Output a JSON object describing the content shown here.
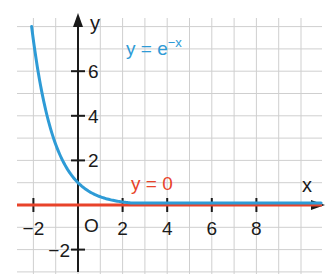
{
  "chart_data": {
    "type": "line",
    "title": "",
    "xlabel": "x",
    "ylabel": "y",
    "xlim": [
      -2.8,
      10.9
    ],
    "ylim": [
      -3.0,
      8.3
    ],
    "grid": true,
    "grid_step": 1,
    "x_ticks": [
      -2,
      2,
      4,
      6,
      8
    ],
    "x_tick_labels": [
      "−2",
      "2",
      "4",
      "6",
      "8"
    ],
    "y_ticks": [
      -2,
      2,
      4,
      6
    ],
    "y_tick_labels": [
      "−2",
      "2",
      "4",
      "6"
    ],
    "origin_label": "O",
    "series": [
      {
        "name": "y = e^(−x)",
        "label_text": "y = e",
        "label_sup": "−x",
        "color": "#2e9bd6",
        "function": "exp(-x)",
        "x": [
          -2.1,
          -2,
          -1.5,
          -1,
          -0.5,
          0,
          0.5,
          1,
          1.5,
          2,
          3,
          4,
          5,
          6,
          8,
          10.9
        ],
        "y": [
          8.17,
          7.39,
          4.48,
          2.72,
          1.65,
          1.0,
          0.61,
          0.37,
          0.22,
          0.14,
          0.05,
          0.02,
          0.007,
          0.002,
          0.0003,
          0.0
        ]
      },
      {
        "name": "y = 0",
        "label_text": "y = 0",
        "color": "#e8432a",
        "function": "0",
        "x": [
          -2.8,
          10.9
        ],
        "y": [
          0,
          0
        ]
      }
    ],
    "annotations": [
      {
        "text": "y = e^(−x)",
        "x": 2.2,
        "y": 6.8,
        "color": "#2e9bd6"
      },
      {
        "text": "y = 0",
        "x": 2.4,
        "y": 0.9,
        "color": "#e8432a"
      }
    ]
  },
  "labels": {
    "x_axis": "x",
    "y_axis": "y",
    "origin": "O",
    "curve_exp_base": "y = e",
    "curve_exp_sup": "−x",
    "curve_zero": "y = 0"
  },
  "colors": {
    "grid": "#cfcfcf",
    "axis": "#1a1a1a",
    "exp_curve": "#2e9bd6",
    "zero_line": "#e8432a"
  }
}
